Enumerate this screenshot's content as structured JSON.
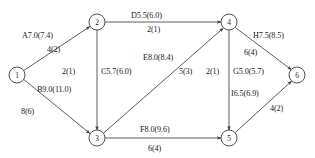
{
  "diagram": {
    "background_color": "#ffffff",
    "line_color": "#4a4a4a",
    "text_color": "#1c1c1c",
    "nodes": [
      {
        "id": "1",
        "label": "1",
        "cx": 17,
        "cy": 75,
        "r": 8
      },
      {
        "id": "2",
        "label": "2",
        "cx": 97,
        "cy": 22,
        "r": 8
      },
      {
        "id": "3",
        "label": "3",
        "cx": 97,
        "cy": 138,
        "r": 8
      },
      {
        "id": "4",
        "label": "4",
        "cx": 229,
        "cy": 22,
        "r": 8
      },
      {
        "id": "5",
        "label": "5",
        "cx": 229,
        "cy": 138,
        "r": 8
      },
      {
        "id": "6",
        "label": "6",
        "cx": 297,
        "cy": 75,
        "r": 8
      }
    ],
    "edges": [
      {
        "id": "A",
        "from": "1",
        "to": "2",
        "primary_label": "A7.0(7.4)",
        "secondary_label": "4(2)"
      },
      {
        "id": "B",
        "from": "1",
        "to": "3",
        "primary_label": "B9.0(11.0)",
        "secondary_label": "8(6)"
      },
      {
        "id": "C",
        "from": "2",
        "to": "3",
        "primary_label": "C5.7(6.0)",
        "secondary_label": "2(1)"
      },
      {
        "id": "D",
        "from": "2",
        "to": "4",
        "primary_label": "D5.5(6.0)",
        "secondary_label": "2(1)"
      },
      {
        "id": "E",
        "from": "3",
        "to": "4",
        "primary_label": "E8.0(8.4)",
        "secondary_label": "5(3)"
      },
      {
        "id": "F",
        "from": "3",
        "to": "5",
        "primary_label": "F8.0(9.6)",
        "secondary_label": "6(4)"
      },
      {
        "id": "G",
        "from": "4",
        "to": "5",
        "primary_label": "G5.0(5.7)",
        "secondary_label": "2(1)"
      },
      {
        "id": "H",
        "from": "4",
        "to": "6",
        "primary_label": "H7.5(8.5)",
        "secondary_label": "6(4)"
      },
      {
        "id": "I",
        "from": "5",
        "to": "6",
        "primary_label": "I6.5(6.9)",
        "secondary_label": "4(2)"
      }
    ],
    "labels": {
      "a_primary": {
        "text": "A7.0(7.4)",
        "x": 22,
        "y": 32
      },
      "a_secondary": {
        "text": "4(2)",
        "x": 47,
        "y": 46
      },
      "b_primary": {
        "text": "B9.0(11.0)",
        "x": 37,
        "y": 86
      },
      "b_secondary": {
        "text": "8(6)",
        "x": 21,
        "y": 108
      },
      "c_primary": {
        "text": "C5.7(6.0)",
        "x": 101,
        "y": 68
      },
      "c_secondary": {
        "text": "2(1)",
        "x": 62,
        "y": 68
      },
      "d_primary": {
        "text": "D5.5(6.0)",
        "x": 131,
        "y": 12
      },
      "d_secondary": {
        "text": "2(1)",
        "x": 147,
        "y": 26
      },
      "e_primary": {
        "text": "E8.0(8.4)",
        "x": 143,
        "y": 54
      },
      "e_secondary": {
        "text": "5(3)",
        "x": 179,
        "y": 68
      },
      "f_primary": {
        "text": "F8.0(9.6)",
        "x": 140,
        "y": 126
      },
      "f_secondary": {
        "text": "6(4)",
        "x": 148,
        "y": 145
      },
      "g_primary": {
        "text": "G5.0(5.7)",
        "x": 233,
        "y": 68
      },
      "g_secondary": {
        "text": "2(1)",
        "x": 206,
        "y": 68
      },
      "h_primary": {
        "text": "H7.5(8.5)",
        "x": 253,
        "y": 32
      },
      "h_secondary": {
        "text": "6(4)",
        "x": 244,
        "y": 49
      },
      "i_primary": {
        "text": "I6.5(6.9)",
        "x": 231,
        "y": 90
      },
      "i_secondary": {
        "text": "4(2)",
        "x": 270,
        "y": 105
      }
    }
  }
}
